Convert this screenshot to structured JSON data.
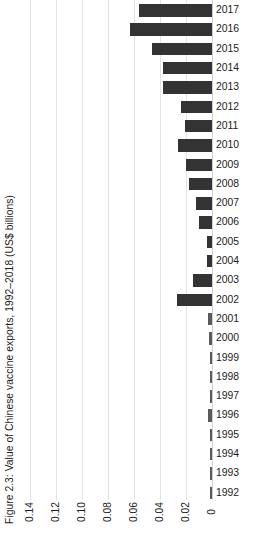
{
  "figure": {
    "caption": "Figure 2.3: Value of Chinese vaccine exports, 1992–2018 (US$ billions)"
  },
  "chart_data": {
    "type": "bar",
    "orientation": "horizontal",
    "title": "Figure 2.3: Value of Chinese vaccine exports, 1992–2018 (US$ billions)",
    "xlabel": "",
    "ylabel": "",
    "xlim": [
      0.15,
      0
    ],
    "x_axis_reversed": true,
    "grid": true,
    "legend": null,
    "bar_color": "#333333",
    "gridline_color": "#e3e3e3",
    "xticks": [
      "0.14",
      "0.12",
      "0.10",
      "0.08",
      "0.06",
      "0.04",
      "0.02",
      "0"
    ],
    "xtick_values": [
      0.14,
      0.12,
      0.1,
      0.08,
      0.06,
      0.04,
      0.02,
      0
    ],
    "categories": [
      "2017",
      "2016",
      "2015",
      "2014",
      "2013",
      "2012",
      "2011",
      "2010",
      "2009",
      "2008",
      "2007",
      "2006",
      "2005",
      "2004",
      "2003",
      "2002",
      "2001",
      "2000",
      "1999",
      "1998",
      "1997",
      "1996",
      "1995",
      "1994",
      "1993",
      "1992"
    ],
    "values": [
      0.056,
      0.063,
      0.046,
      0.038,
      0.038,
      0.024,
      0.021,
      0.026,
      0.02,
      0.018,
      0.012,
      0.01,
      0.004,
      0.004,
      0.015,
      0.027,
      0.003,
      0.002,
      0.001,
      0.001,
      0.001,
      0.003,
      0.001,
      0.001,
      0.001,
      0.001
    ],
    "units": "US$ billions",
    "note": "Bars are drawn right-to-left from the zero axis at the right edge of the plot."
  }
}
